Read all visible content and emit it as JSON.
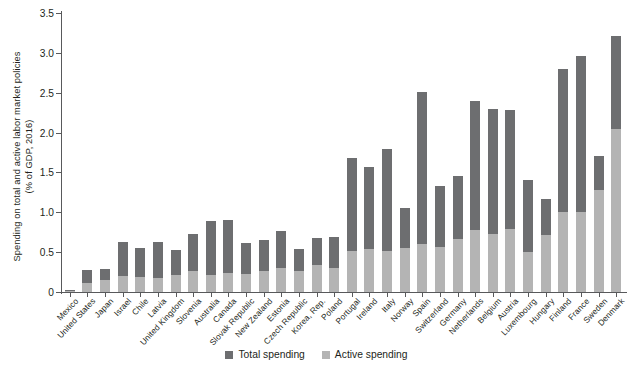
{
  "chart_data": {
    "type": "bar",
    "title": "",
    "subtitle": "",
    "xlabel": "",
    "ylabel": "Spending on total and active labor market policies\n(% of GDP, 2016)",
    "ylim": [
      0,
      3.5
    ],
    "yticks": [
      "0",
      "0.5",
      "1.0",
      "1.5",
      "2.0",
      "2.5",
      "3.0",
      "3.5"
    ],
    "ytick_values": [
      0,
      0.5,
      1.0,
      1.5,
      2.0,
      2.5,
      3.0,
      3.5
    ],
    "grid": false,
    "legend_position": "bottom-center",
    "stacked": true,
    "categories": [
      "Mexico",
      "United States",
      "Japan",
      "Israel",
      "Chile",
      "Latvia",
      "United Kingdom",
      "Slovenia",
      "Australia",
      "Canada",
      "Slovak Republic",
      "New Zealand",
      "Estonia",
      "Czech Republic",
      "Korea, Rep.",
      "Poland",
      "Portugal",
      "Ireland",
      "Italy",
      "Norway",
      "Spain",
      "Switzerland",
      "Germany",
      "Netherlands",
      "Belgium",
      "Austria",
      "Luxembourg",
      "Hungary",
      "Finland",
      "France",
      "Sweden",
      "Denmark"
    ],
    "series": [
      {
        "name": "Total spending",
        "color": "#6d6e70",
        "values": [
          0.02,
          0.27,
          0.29,
          0.63,
          0.55,
          0.63,
          0.53,
          0.73,
          0.89,
          0.9,
          0.61,
          0.65,
          0.77,
          0.54,
          0.68,
          0.69,
          1.68,
          1.57,
          1.8,
          1.05,
          2.51,
          1.33,
          1.45,
          2.4,
          2.3,
          2.28,
          1.4,
          1.17,
          2.8,
          2.96,
          1.71,
          3.21
        ]
      },
      {
        "name": "Active spending",
        "color": "#b4b4b4",
        "values": [
          0.01,
          0.11,
          0.15,
          0.2,
          0.19,
          0.18,
          0.21,
          0.26,
          0.21,
          0.24,
          0.22,
          0.26,
          0.3,
          0.26,
          0.34,
          0.3,
          0.51,
          0.54,
          0.51,
          0.55,
          0.6,
          0.57,
          0.66,
          0.78,
          0.73,
          0.79,
          0.5,
          0.72,
          1.0,
          1.0,
          1.28,
          2.05
        ]
      }
    ]
  },
  "legend": {
    "items": [
      {
        "label": "Total spending",
        "swatch": "total-swatch"
      },
      {
        "label": "Active spending",
        "swatch": "active-swatch"
      }
    ]
  }
}
